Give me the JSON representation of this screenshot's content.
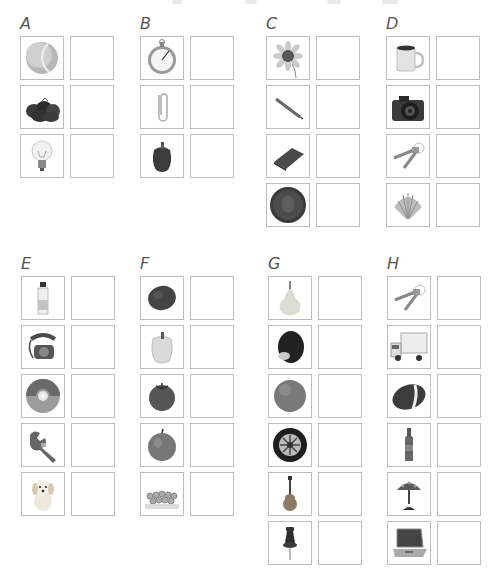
{
  "worksheet": {
    "groups": [
      {
        "label": "A",
        "items": [
          {
            "name": "tennis-ball",
            "icon": "tennis-ball-icon"
          },
          {
            "name": "strawberries",
            "icon": "strawberries-icon"
          },
          {
            "name": "light-bulb",
            "icon": "light-bulb-icon"
          }
        ]
      },
      {
        "label": "B",
        "items": [
          {
            "name": "stopwatch",
            "icon": "stopwatch-icon"
          },
          {
            "name": "paper-clip",
            "icon": "paper-clip-icon"
          },
          {
            "name": "bell-pepper",
            "icon": "bell-pepper-icon"
          }
        ]
      },
      {
        "label": "C",
        "items": [
          {
            "name": "sunflower",
            "icon": "sunflower-icon"
          },
          {
            "name": "pencil",
            "icon": "pencil-icon"
          },
          {
            "name": "book",
            "icon": "book-icon"
          },
          {
            "name": "penny",
            "icon": "penny-icon"
          }
        ]
      },
      {
        "label": "D",
        "items": [
          {
            "name": "mug",
            "icon": "mug-icon"
          },
          {
            "name": "camera",
            "icon": "camera-icon"
          },
          {
            "name": "keys",
            "icon": "keys-icon"
          },
          {
            "name": "seashell",
            "icon": "seashell-icon"
          }
        ]
      },
      {
        "label": "E",
        "items": [
          {
            "name": "water-bottle",
            "icon": "water-bottle-icon"
          },
          {
            "name": "telephone",
            "icon": "telephone-icon"
          },
          {
            "name": "cd",
            "icon": "cd-icon"
          },
          {
            "name": "wrench",
            "icon": "wrench-icon"
          },
          {
            "name": "puppy",
            "icon": "puppy-icon"
          }
        ]
      },
      {
        "label": "F",
        "items": [
          {
            "name": "potato",
            "icon": "potato-icon"
          },
          {
            "name": "pepper",
            "icon": "pepper-icon"
          },
          {
            "name": "tomato",
            "icon": "tomato-icon"
          },
          {
            "name": "apple",
            "icon": "apple-icon"
          },
          {
            "name": "grapes",
            "icon": "grapes-icon"
          }
        ]
      },
      {
        "label": "G",
        "items": [
          {
            "name": "pear",
            "icon": "pear-icon"
          },
          {
            "name": "avocado",
            "icon": "avocado-icon"
          },
          {
            "name": "orange",
            "icon": "orange-icon"
          },
          {
            "name": "tire",
            "icon": "tire-icon"
          },
          {
            "name": "guitar",
            "icon": "guitar-icon"
          },
          {
            "name": "push-pin",
            "icon": "push-pin-icon"
          }
        ]
      },
      {
        "label": "H",
        "items": [
          {
            "name": "keys",
            "icon": "keys-icon"
          },
          {
            "name": "truck",
            "icon": "truck-icon"
          },
          {
            "name": "football",
            "icon": "football-icon"
          },
          {
            "name": "bottle",
            "icon": "bottle-icon"
          },
          {
            "name": "lamp",
            "icon": "lamp-icon"
          },
          {
            "name": "laptop",
            "icon": "laptop-icon"
          }
        ]
      }
    ]
  },
  "colors": {
    "border": "#bdbdbd",
    "label": "#555555",
    "background": "#ffffff"
  }
}
